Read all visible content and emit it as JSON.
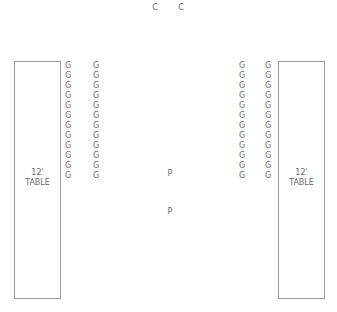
{
  "colors": {
    "line": "#9a9a9a",
    "text": "#6a6a6a"
  },
  "chairs_top": [
    {
      "label": "C",
      "x": 155,
      "y": 4
    },
    {
      "label": "C",
      "x": 181,
      "y": 4
    }
  ],
  "tables": [
    {
      "id": "left",
      "line1": "12'",
      "line2": "TABLE",
      "x": 14,
      "y": 61,
      "w": 47,
      "h": 238
    },
    {
      "id": "right",
      "line1": "12'",
      "line2": "TABLE",
      "x": 278,
      "y": 61,
      "w": 47,
      "h": 238
    }
  ],
  "guest_label": "G",
  "guest_rows": 12,
  "guest_columns_x": [
    68,
    96,
    242,
    268
  ],
  "guest_start_y": 62,
  "guest_row_spacing": 10,
  "podiums": [
    {
      "label": "P",
      "x": 170,
      "y": 170
    },
    {
      "label": "P",
      "x": 170,
      "y": 208
    }
  ]
}
